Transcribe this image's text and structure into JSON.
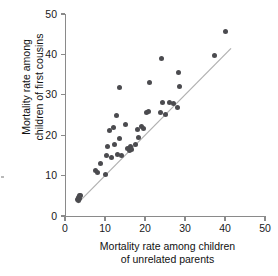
{
  "figure": {
    "background_color": "#ffffff",
    "point_color": "#4b4b4f",
    "axis_color": "#8a8a8a",
    "reference_line_color": "#b0b0b0"
  },
  "chart_data": {
    "type": "scatter",
    "title": "",
    "xlabel_line1": "Mortality rate among children",
    "xlabel_line2": "of unrelated parents",
    "ylabel_line1": "Mortality rate among",
    "ylabel_line2": "children of first cousins",
    "xlim": [
      0,
      50
    ],
    "ylim": [
      0,
      50
    ],
    "xticks": [
      0,
      10,
      20,
      30,
      40,
      50
    ],
    "yticks": [
      0,
      10,
      20,
      30,
      40,
      50
    ],
    "xtick_labels": [
      "0",
      "10",
      "20",
      "30",
      "40",
      "50"
    ],
    "ytick_labels": [
      "0",
      "10",
      "20",
      "30",
      "40",
      "50"
    ],
    "grid": false,
    "legend": false,
    "annotations": [
      {
        "type": "reference_line",
        "description": "1:1 diagonal equality line",
        "from": [
          3.2,
          3.2
        ],
        "to": [
          41.5,
          41.5
        ],
        "color": "#b0b0b0"
      }
    ],
    "series": [
      {
        "name": "Populations",
        "marker": "filled-circle",
        "color": "#4b4b4f",
        "points": [
          [
            3.0,
            4.2
          ],
          [
            3.3,
            4.6
          ],
          [
            3.4,
            3.9
          ],
          [
            3.6,
            5.0
          ],
          [
            3.7,
            4.4
          ],
          [
            3.9,
            5.1
          ],
          [
            7.7,
            11.3
          ],
          [
            8.0,
            10.8
          ],
          [
            8.9,
            13.0
          ],
          [
            10.0,
            10.2
          ],
          [
            10.3,
            14.9
          ],
          [
            10.6,
            17.3
          ],
          [
            11.2,
            21.1
          ],
          [
            11.6,
            14.6
          ],
          [
            12.0,
            22.0
          ],
          [
            12.4,
            17.7
          ],
          [
            12.8,
            24.8
          ],
          [
            13.2,
            15.2
          ],
          [
            13.5,
            31.8
          ],
          [
            13.6,
            19.2
          ],
          [
            14.0,
            14.9
          ],
          [
            15.2,
            22.6
          ],
          [
            15.6,
            16.6
          ],
          [
            16.0,
            16.2
          ],
          [
            16.3,
            17.1
          ],
          [
            16.6,
            16.5
          ],
          [
            17.5,
            17.6
          ],
          [
            18.0,
            21.3
          ],
          [
            18.4,
            19.5
          ],
          [
            19.1,
            22.1
          ],
          [
            19.6,
            21.7
          ],
          [
            20.4,
            25.7
          ],
          [
            20.9,
            25.8
          ],
          [
            21.2,
            33.0
          ],
          [
            23.8,
            25.6
          ],
          [
            24.2,
            38.9
          ],
          [
            24.4,
            28.2
          ],
          [
            25.0,
            25.2
          ],
          [
            26.0,
            28.0
          ],
          [
            27.2,
            27.9
          ],
          [
            28.1,
            26.8
          ],
          [
            28.4,
            35.4
          ],
          [
            28.6,
            32.1
          ],
          [
            37.4,
            39.7
          ],
          [
            40.1,
            45.6
          ]
        ]
      }
    ]
  }
}
